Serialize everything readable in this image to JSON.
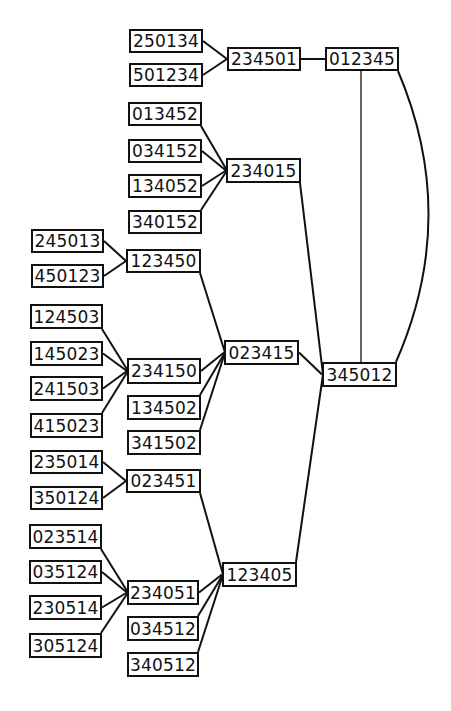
{
  "diagram": {
    "type": "permutation-graph",
    "colors": {
      "stroke": "#111111",
      "background": "#ffffff",
      "text": "#111111"
    },
    "nodes": [
      {
        "id": "250134",
        "label": "250134",
        "x": 129,
        "y": 29,
        "w": 74,
        "h": 24
      },
      {
        "id": "501234",
        "label": "501234",
        "x": 129,
        "y": 63,
        "w": 74,
        "h": 24
      },
      {
        "id": "234501",
        "label": "234501",
        "x": 227,
        "y": 47,
        "w": 74,
        "h": 24
      },
      {
        "id": "012345",
        "label": "012345",
        "x": 325,
        "y": 47,
        "w": 74,
        "h": 24
      },
      {
        "id": "013452",
        "label": "013452",
        "x": 128,
        "y": 102,
        "w": 74,
        "h": 24
      },
      {
        "id": "034152",
        "label": "034152",
        "x": 128,
        "y": 139,
        "w": 74,
        "h": 24
      },
      {
        "id": "134052",
        "label": "134052",
        "x": 128,
        "y": 174,
        "w": 74,
        "h": 24
      },
      {
        "id": "340152",
        "label": "340152",
        "x": 128,
        "y": 210,
        "w": 74,
        "h": 24
      },
      {
        "id": "234015",
        "label": "234015",
        "x": 226,
        "y": 158,
        "w": 75,
        "h": 25
      },
      {
        "id": "245013",
        "label": "245013",
        "x": 31,
        "y": 229,
        "w": 73,
        "h": 24
      },
      {
        "id": "450123",
        "label": "450123",
        "x": 31,
        "y": 264,
        "w": 73,
        "h": 24
      },
      {
        "id": "123450",
        "label": "123450",
        "x": 126,
        "y": 249,
        "w": 75,
        "h": 24
      },
      {
        "id": "124503",
        "label": "124503",
        "x": 30,
        "y": 304,
        "w": 73,
        "h": 25
      },
      {
        "id": "145023",
        "label": "145023",
        "x": 30,
        "y": 341,
        "w": 73,
        "h": 25
      },
      {
        "id": "241503",
        "label": "241503",
        "x": 30,
        "y": 376,
        "w": 73,
        "h": 25
      },
      {
        "id": "415023",
        "label": "415023",
        "x": 30,
        "y": 413,
        "w": 73,
        "h": 25
      },
      {
        "id": "234150",
        "label": "234150",
        "x": 127,
        "y": 358,
        "w": 74,
        "h": 26
      },
      {
        "id": "134502",
        "label": "134502",
        "x": 127,
        "y": 395,
        "w": 74,
        "h": 25
      },
      {
        "id": "341502",
        "label": "341502",
        "x": 127,
        "y": 430,
        "w": 74,
        "h": 25
      },
      {
        "id": "023415",
        "label": "023415",
        "x": 224,
        "y": 340,
        "w": 75,
        "h": 25
      },
      {
        "id": "345012",
        "label": "345012",
        "x": 322,
        "y": 362,
        "w": 75,
        "h": 25
      },
      {
        "id": "235014",
        "label": "235014",
        "x": 30,
        "y": 450,
        "w": 73,
        "h": 24
      },
      {
        "id": "350124",
        "label": "350124",
        "x": 30,
        "y": 486,
        "w": 73,
        "h": 24
      },
      {
        "id": "023451",
        "label": "023451",
        "x": 126,
        "y": 469,
        "w": 75,
        "h": 24
      },
      {
        "id": "023514",
        "label": "023514",
        "x": 29,
        "y": 524,
        "w": 73,
        "h": 25
      },
      {
        "id": "035124",
        "label": "035124",
        "x": 29,
        "y": 560,
        "w": 73,
        "h": 24
      },
      {
        "id": "230514",
        "label": "230514",
        "x": 29,
        "y": 595,
        "w": 73,
        "h": 25
      },
      {
        "id": "305124",
        "label": "305124",
        "x": 29,
        "y": 633,
        "w": 73,
        "h": 25
      },
      {
        "id": "234051",
        "label": "234051",
        "x": 127,
        "y": 580,
        "w": 72,
        "h": 25
      },
      {
        "id": "034512",
        "label": "034512",
        "x": 127,
        "y": 616,
        "w": 72,
        "h": 25
      },
      {
        "id": "340512",
        "label": "340512",
        "x": 127,
        "y": 652,
        "w": 72,
        "h": 25
      },
      {
        "id": "123405",
        "label": "123405",
        "x": 222,
        "y": 562,
        "w": 75,
        "h": 25
      }
    ],
    "edges": [
      {
        "from": "250134",
        "to": "234501"
      },
      {
        "from": "501234",
        "to": "234501"
      },
      {
        "from": "234501",
        "to": "012345"
      },
      {
        "from": "012345",
        "to": "345012",
        "style": "straight-vertical"
      },
      {
        "from": "012345",
        "to": "345012",
        "style": "arc"
      },
      {
        "from": "013452",
        "to": "234015"
      },
      {
        "from": "034152",
        "to": "234015"
      },
      {
        "from": "134052",
        "to": "234015"
      },
      {
        "from": "340152",
        "to": "234015"
      },
      {
        "from": "234015",
        "to": "345012"
      },
      {
        "from": "245013",
        "to": "123450"
      },
      {
        "from": "450123",
        "to": "123450"
      },
      {
        "from": "123450",
        "to": "023415"
      },
      {
        "from": "124503",
        "to": "234150"
      },
      {
        "from": "145023",
        "to": "234150"
      },
      {
        "from": "241503",
        "to": "234150"
      },
      {
        "from": "415023",
        "to": "234150"
      },
      {
        "from": "234150",
        "to": "023415"
      },
      {
        "from": "134502",
        "to": "023415"
      },
      {
        "from": "341502",
        "to": "023415"
      },
      {
        "from": "023415",
        "to": "345012"
      },
      {
        "from": "235014",
        "to": "023451"
      },
      {
        "from": "350124",
        "to": "023451"
      },
      {
        "from": "023451",
        "to": "123405"
      },
      {
        "from": "023514",
        "to": "234051"
      },
      {
        "from": "035124",
        "to": "234051"
      },
      {
        "from": "230514",
        "to": "234051"
      },
      {
        "from": "305124",
        "to": "234051"
      },
      {
        "from": "234051",
        "to": "123405"
      },
      {
        "from": "034512",
        "to": "123405"
      },
      {
        "from": "340512",
        "to": "123405"
      },
      {
        "from": "123405",
        "to": "345012"
      }
    ]
  }
}
